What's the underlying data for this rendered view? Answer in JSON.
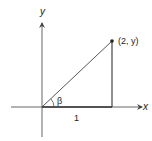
{
  "diagram": {
    "axes": {
      "x_label": "x",
      "y_label": "y"
    },
    "point_label": "(2, y)",
    "base_label": "1",
    "angle_label": "β",
    "colors": {
      "stroke": "#444444",
      "text": "#222222",
      "background": "#ffffff"
    }
  }
}
